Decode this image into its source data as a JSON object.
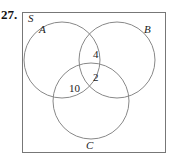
{
  "problem_number": "27.",
  "diagram": {
    "universe_label": "S",
    "sets": [
      {
        "name": "A"
      },
      {
        "name": "B"
      },
      {
        "name": "C"
      }
    ],
    "regions": [
      {
        "sets": [
          "A",
          "B"
        ],
        "only": true,
        "value": "4"
      },
      {
        "sets": [
          "A",
          "B",
          "C"
        ],
        "value": "2"
      },
      {
        "sets": [
          "A",
          "C"
        ],
        "only": true,
        "value": "10"
      }
    ]
  },
  "colors": {
    "stroke": "#777777",
    "text": "#222222"
  }
}
